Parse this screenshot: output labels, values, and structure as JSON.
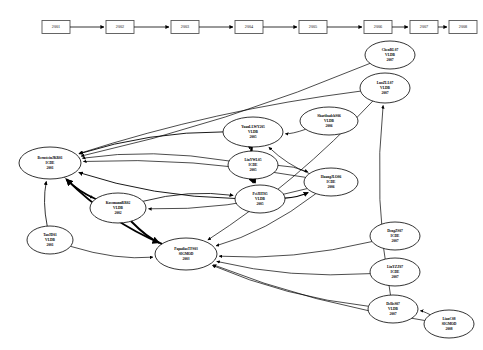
{
  "diagram": {
    "type": "directed-graph",
    "background_color": "#ffffff",
    "node_fill": "#ffffff",
    "node_stroke": "#000000",
    "edge_color": "#000000"
  },
  "timeline": {
    "name": "year-timeline",
    "years": [
      {
        "label": "2001",
        "x": 56,
        "y": 27
      },
      {
        "label": "2002",
        "x": 120,
        "y": 27
      },
      {
        "label": "2003",
        "x": 185,
        "y": 27
      },
      {
        "label": "2004",
        "x": 249,
        "y": 27
      },
      {
        "label": "2005",
        "x": 313,
        "y": 27
      },
      {
        "label": "2006",
        "x": 378,
        "y": 27
      },
      {
        "label": "2007",
        "x": 424,
        "y": 27
      },
      {
        "label": "2008",
        "x": 463,
        "y": 27
      }
    ]
  },
  "nodes": [
    {
      "id": "bernstein01",
      "author": "BernsteinJKR01",
      "venue": "ICDE",
      "year": "2001",
      "cx": 50,
      "cy": 163,
      "rx": 31,
      "ry": 16
    },
    {
      "id": "tao01",
      "author": "TaoJD01",
      "venue": "VLDB",
      "year": "2001",
      "cx": 50,
      "cy": 240,
      "rx": 23,
      "ry": 14
    },
    {
      "id": "kossmann02",
      "author": "KossmannRR02",
      "venue": "VLDB",
      "year": "2002",
      "cx": 118,
      "cy": 208,
      "rx": 28,
      "ry": 15
    },
    {
      "id": "papadias03",
      "author": "PapadiasTFS03",
      "venue": "SIGMOD",
      "year": "2003",
      "cx": 186,
      "cy": 254,
      "rx": 31,
      "ry": 16
    },
    {
      "id": "yuan05",
      "author": "YuanLLWY205",
      "venue": "VLDB",
      "year": "2005",
      "cx": 253,
      "cy": 132,
      "rx": 30,
      "ry": 15
    },
    {
      "id": "lin05",
      "author": "LinYWL05",
      "venue": "ICDE",
      "year": "2005",
      "cx": 253,
      "cy": 165,
      "rx": 25,
      "ry": 14
    },
    {
      "id": "pei05",
      "author": "PeiJHT05",
      "venue": "VLDB",
      "year": "2005",
      "cx": 260,
      "cy": 199,
      "rx": 25,
      "ry": 14
    },
    {
      "id": "sharifzadeh06",
      "author": "SharifzadehS06",
      "venue": "VLDB",
      "year": "2006",
      "cx": 329,
      "cy": 121,
      "rx": 29,
      "ry": 14
    },
    {
      "id": "huang06",
      "author": "HuangJLO06",
      "venue": "ICDE",
      "year": "2006",
      "cx": 331,
      "cy": 182,
      "rx": 27,
      "ry": 14
    },
    {
      "id": "luo07",
      "author": "LuoZLL07",
      "venue": "VLDB",
      "year": "2007",
      "cx": 385,
      "cy": 88,
      "rx": 25,
      "ry": 15
    },
    {
      "id": "chen07",
      "author": "ChenRL07",
      "venue": "VLDB",
      "year": "2007",
      "cx": 390,
      "cy": 55,
      "rx": 25,
      "ry": 14
    },
    {
      "id": "deng07",
      "author": "DengZS07",
      "venue": "ICDE",
      "year": "2007",
      "cx": 395,
      "cy": 236,
      "rx": 25,
      "ry": 14
    },
    {
      "id": "linyz07",
      "author": "LinYZZ07",
      "venue": "ICDE",
      "year": "2007",
      "cx": 395,
      "cy": 272,
      "rx": 25,
      "ry": 14
    },
    {
      "id": "dellis07",
      "author": "DellisS07",
      "venue": "VLDB",
      "year": "2007",
      "cx": 393,
      "cy": 309,
      "rx": 25,
      "ry": 14
    },
    {
      "id": "lian08",
      "author": "LianC08",
      "venue": "SIGMOD",
      "year": "2008",
      "cx": 449,
      "cy": 324,
      "rx": 25,
      "ry": 14
    }
  ],
  "edges": [
    {
      "from": "luo07",
      "to": "bernstein01",
      "weight": 0.7
    },
    {
      "from": "chen07",
      "to": "bernstein01",
      "weight": 0.7
    },
    {
      "from": "yuan05",
      "to": "bernstein01",
      "weight": 0.9
    },
    {
      "from": "lin05",
      "to": "bernstein01",
      "weight": 0.7
    },
    {
      "from": "pei05",
      "to": "bernstein01",
      "weight": 0.9
    },
    {
      "from": "huang06",
      "to": "bernstein01",
      "weight": 0.7
    },
    {
      "from": "kossmann02",
      "to": "bernstein01",
      "weight": 1.6
    },
    {
      "from": "papadias03",
      "to": "bernstein01",
      "weight": 1.8
    },
    {
      "from": "tao01",
      "to": "bernstein01",
      "weight": 0.8
    },
    {
      "from": "tao01",
      "to": "papadias03",
      "weight": 0.7
    },
    {
      "from": "bernstein01",
      "to": "kossmann02",
      "weight": 0.7
    },
    {
      "from": "kossmann02",
      "to": "papadias03",
      "weight": 1.9
    },
    {
      "from": "kossmann02",
      "to": "pei05",
      "weight": 0.8
    },
    {
      "from": "yuan05",
      "to": "pei05",
      "weight": 2.4
    },
    {
      "from": "yuan05",
      "to": "lin05",
      "weight": 1.4
    },
    {
      "from": "lin05",
      "to": "pei05",
      "weight": 1.2
    },
    {
      "from": "lin05",
      "to": "huang06",
      "weight": 0.7
    },
    {
      "from": "pei05",
      "to": "huang06",
      "weight": 1.3
    },
    {
      "from": "sharifzadeh06",
      "to": "yuan05",
      "weight": 0.7
    },
    {
      "from": "huang06",
      "to": "yuan05",
      "weight": 0.7
    },
    {
      "from": "huang06",
      "to": "kossmann02",
      "weight": 0.7
    },
    {
      "from": "huang06",
      "to": "papadias03",
      "weight": 0.7
    },
    {
      "from": "luo07",
      "to": "papadias03",
      "weight": 0.7
    },
    {
      "from": "deng07",
      "to": "papadias03",
      "weight": 0.7
    },
    {
      "from": "linyz07",
      "to": "papadias03",
      "weight": 0.7
    },
    {
      "from": "dellis07",
      "to": "papadias03",
      "weight": 0.7
    },
    {
      "from": "lian08",
      "to": "papadias03",
      "weight": 0.7
    },
    {
      "from": "lian08",
      "to": "dellis07",
      "weight": 0.7
    },
    {
      "from": "dellis07",
      "to": "luo07",
      "weight": 0.7
    }
  ]
}
